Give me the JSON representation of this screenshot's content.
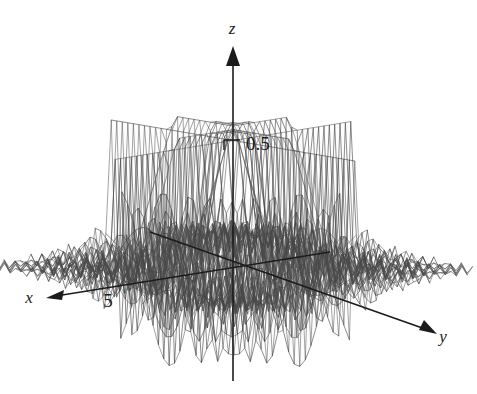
{
  "figure": {
    "type": "surface-plot-3d",
    "background_color": "#ffffff",
    "line_color": "#3b3b3b",
    "axis_color": "#1c1c1c",
    "width": 477,
    "height": 394
  },
  "axes": {
    "z": {
      "label": "z",
      "label_x": 232,
      "label_y": 34,
      "arrow_dir": "up",
      "ticks": [
        {
          "value": "0.5",
          "label_x": 246,
          "label_y": 146,
          "tick_x": 233,
          "tick_y": 140
        }
      ]
    },
    "x": {
      "label": "x",
      "label_x": 29,
      "label_y": 303,
      "arrow_dir": "down-left",
      "ticks": [
        {
          "value": "5",
          "label_x": 108,
          "label_y": 305
        }
      ]
    },
    "y": {
      "label": "y",
      "label_x": 443,
      "label_y": 342,
      "arrow_dir": "down-right",
      "ticks": []
    }
  },
  "chart_data": {
    "type": "surface",
    "title": "",
    "xlabel": "x",
    "ylabel": "y",
    "zlabel": "z",
    "xlim": [
      -9,
      9
    ],
    "ylim": [
      -9,
      9
    ],
    "zlim": [
      -0.6,
      0.55
    ],
    "x_ticks": [
      5
    ],
    "y_ticks": [],
    "z_ticks": [
      0.5
    ],
    "grid": false,
    "legend": false,
    "mesh_style": "wireframe",
    "mesh_nu": 44,
    "mesh_nv": 44,
    "function": "z = sin(x*y)/(x*y) style oscillatory ridge with sharp drop near origin",
    "projection": {
      "origin_px": [
        233,
        268
      ],
      "x_axis_px": [
        -0.735,
        0.118
      ],
      "y_axis_px": [
        0.76,
        0.128
      ],
      "z_axis_px": [
        0.0,
        -0.255
      ],
      "x_unit_scale": 17.8,
      "y_unit_scale": 17.8,
      "z_unit_scale": 255
    }
  }
}
